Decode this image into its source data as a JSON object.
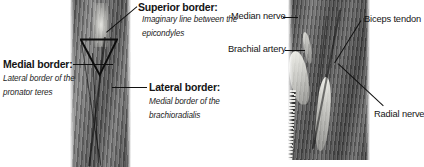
{
  "figure": {
    "domain_kind": "anatomy-illustration",
    "background_color": "#ffffff",
    "text_color": "#151515",
    "leader_line_color": "#101010",
    "width_px": 424,
    "height_px": 167
  },
  "left_panel": {
    "name": "cubital-fossa-borders",
    "photo_alt": "Grayscale photograph of the anterior elbow showing the cubital fossa borders",
    "labels": [
      {
        "id": "superior-border",
        "heading": "Superior border:",
        "subtext_line1": "Imaginary line between the",
        "subtext_line2": "epicondyles"
      },
      {
        "id": "medial-border",
        "heading": "Medial border:",
        "subtext_line1": "Lateral border of the",
        "subtext_line2": "pronator teres"
      },
      {
        "id": "lateral-border",
        "heading": "Lateral border:",
        "subtext_line1": "Medial border of the",
        "subtext_line2": "brachioradialis"
      }
    ]
  },
  "right_panel": {
    "name": "cubital-fossa-contents",
    "photo_alt": "Grayscale photograph of a dissected cubital fossa showing its contents",
    "labels": [
      {
        "id": "median-nerve",
        "text": "Median nerve"
      },
      {
        "id": "brachial-artery",
        "text": "Brachial artery"
      },
      {
        "id": "biceps-tendon",
        "text": "Biceps tendon"
      },
      {
        "id": "radial-nerve",
        "text": "Radial nerve"
      }
    ]
  }
}
